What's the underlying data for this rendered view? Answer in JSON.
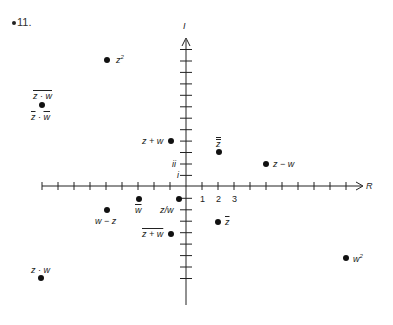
{
  "problem_number": "11.",
  "axes": {
    "real_label": "R",
    "imag_label": "I",
    "x_tick_labels": [
      "1",
      "2",
      "3"
    ],
    "y_tick_labels": [
      "i",
      "ii"
    ]
  },
  "points": [
    {
      "id": "z2",
      "label": "z",
      "sup": "2",
      "x": 107,
      "y": 60
    },
    {
      "id": "conj-zw",
      "label_top": "z · w",
      "label_bottom": "z · w",
      "x": 42,
      "y": 105
    },
    {
      "id": "z-plus-w",
      "label": "z + w",
      "x": 171,
      "y": 141
    },
    {
      "id": "z-double-bar",
      "label": "z",
      "x": 219,
      "y": 152
    },
    {
      "id": "z-minus-w",
      "label": "z − w",
      "x": 266,
      "y": 164
    },
    {
      "id": "w-bar",
      "label": "w",
      "x": 139,
      "y": 199
    },
    {
      "id": "z-over-w",
      "label": "z/w",
      "x": 179,
      "y": 199
    },
    {
      "id": "w-minus-z",
      "label": "w − z",
      "x": 107,
      "y": 210
    },
    {
      "id": "z-bar",
      "label": "z",
      "x": 218,
      "y": 222
    },
    {
      "id": "conj-z-plus-w",
      "label": "z + w",
      "x": 171,
      "y": 234
    },
    {
      "id": "w2",
      "label": "w",
      "sup": "2",
      "x": 346,
      "y": 258
    },
    {
      "id": "z-times-w",
      "label": "z · w",
      "x": 41,
      "y": 278
    }
  ],
  "colors": {
    "ink": "#111111",
    "background": "#ffffff"
  }
}
